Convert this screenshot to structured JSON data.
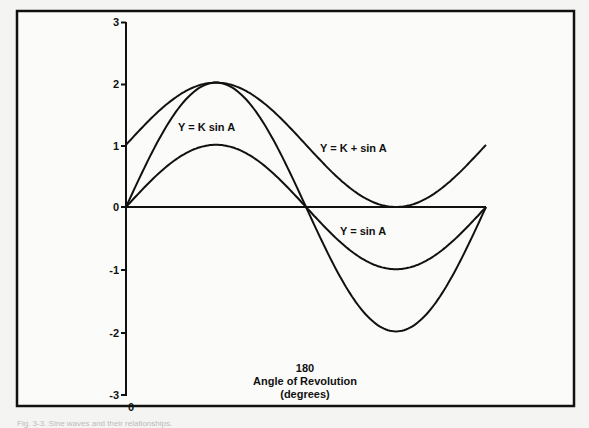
{
  "chart_data": {
    "type": "line",
    "title": "",
    "xlabel": "Angle of Revolution (degrees)",
    "xlabel_lines": [
      "Angle of Revolution",
      "(degrees)"
    ],
    "ylabel": "",
    "xlim": [
      0,
      360
    ],
    "ylim": [
      -3,
      3
    ],
    "x_ticks": [
      {
        "value": 0,
        "label": "0"
      },
      {
        "value": 180,
        "label": "180"
      }
    ],
    "y_ticks": [
      {
        "value": 3,
        "label": "3"
      },
      {
        "value": 2,
        "label": "2"
      },
      {
        "value": 1,
        "label": "1"
      },
      {
        "value": 0,
        "label": "0"
      },
      {
        "value": -1,
        "label": "-1"
      },
      {
        "value": -2,
        "label": "-2"
      },
      {
        "value": -3,
        "label": "-3"
      }
    ],
    "grid": false,
    "legend": "inline labels",
    "x": [
      0,
      30,
      60,
      90,
      120,
      150,
      180,
      210,
      240,
      270,
      300,
      330,
      360
    ],
    "series": [
      {
        "name": "Y = sin A",
        "values": [
          0,
          0.5,
          0.87,
          1,
          0.87,
          0.5,
          0,
          -0.5,
          -0.87,
          -1,
          -0.87,
          -0.5,
          0
        ]
      },
      {
        "name": "Y = K sin A",
        "values": [
          0,
          1,
          1.73,
          2,
          1.73,
          1,
          0,
          -1,
          -1.73,
          -2,
          -1.73,
          -1,
          0
        ]
      },
      {
        "name": "Y = K + sin A",
        "values": [
          1,
          1.5,
          1.87,
          2,
          1.87,
          1.5,
          1,
          0.5,
          0.13,
          0,
          0.13,
          0.5,
          1
        ]
      }
    ],
    "annotations": [
      {
        "text": "Y = K sin A",
        "near_series": "Y = K sin A"
      },
      {
        "text": "Y = K + sin A",
        "near_series": "Y = K + sin A"
      },
      {
        "text": "Y = sin A",
        "near_series": "Y = sin A"
      }
    ],
    "constants": {
      "K": 1
    }
  },
  "labels": {
    "ktimes": "Y = K sin A",
    "kplus": "Y = K + sin A",
    "sin": "Y = sin A",
    "x_tick_0": "0",
    "x_tick_180": "180",
    "x_title_1": "Angle of Revolution",
    "x_title_2": "(degrees)",
    "y3": "3",
    "y2": "2",
    "y1": "1",
    "y0": "0",
    "ym1": "-1",
    "ym2": "-2",
    "ym3": "-3"
  },
  "caption": "Fig. 3-3. Sine waves and their relationships."
}
